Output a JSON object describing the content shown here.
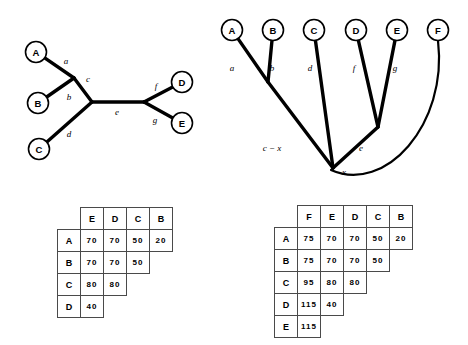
{
  "figure": {
    "unrooted_tree": {
      "name": "unrooted-phylogenetic-tree",
      "taxa": [
        {
          "id": "A",
          "label": "A",
          "cx": 36,
          "cy": 52
        },
        {
          "id": "B",
          "label": "B",
          "cx": 38,
          "cy": 103
        },
        {
          "id": "C",
          "label": "C",
          "cx": 39,
          "cy": 149
        },
        {
          "id": "D",
          "label": "D",
          "cx": 182,
          "cy": 82
        },
        {
          "id": "E",
          "label": "E",
          "cx": 182,
          "cy": 123
        }
      ],
      "internal_nodes": [
        {
          "id": "ab",
          "x": 74,
          "y": 78
        },
        {
          "id": "abc",
          "x": 92,
          "y": 102
        },
        {
          "id": "de",
          "x": 144,
          "y": 102
        }
      ],
      "edges": [
        {
          "id": "a",
          "label": "a",
          "from": "A",
          "to": "ab",
          "lx": 66,
          "ly": 61
        },
        {
          "id": "b",
          "label": "b",
          "from": "B",
          "to": "ab",
          "lx": 69,
          "ly": 97
        },
        {
          "id": "c",
          "label": "c",
          "from": "ab",
          "to": "abc",
          "lx": 88,
          "ly": 79
        },
        {
          "id": "d",
          "label": "d",
          "from": "C",
          "to": "abc",
          "lx": 69,
          "ly": 134
        },
        {
          "id": "e",
          "label": "e",
          "from": "abc",
          "to": "de",
          "lx": 117,
          "ly": 112
        },
        {
          "id": "f",
          "label": "f",
          "from": "de",
          "to": "D",
          "lx": 156,
          "ly": 86
        },
        {
          "id": "g",
          "label": "g",
          "from": "de",
          "to": "E",
          "lx": 155,
          "ly": 120
        }
      ]
    },
    "rooted_tree": {
      "name": "rooted-phylogenetic-tree",
      "taxa": [
        {
          "id": "A",
          "label": "A",
          "cx": 232,
          "cy": 30
        },
        {
          "id": "B",
          "label": "B",
          "cx": 273,
          "cy": 30
        },
        {
          "id": "C",
          "label": "C",
          "cx": 314,
          "cy": 30
        },
        {
          "id": "D",
          "label": "D",
          "cx": 356,
          "cy": 30
        },
        {
          "id": "E",
          "label": "E",
          "cx": 397,
          "cy": 30
        },
        {
          "id": "F",
          "label": "F",
          "cx": 438,
          "cy": 30
        }
      ],
      "internal_nodes": [
        {
          "id": "ab",
          "x": 268,
          "y": 82
        },
        {
          "id": "de",
          "x": 378,
          "y": 127
        },
        {
          "id": "x",
          "x": 333,
          "y": 168
        }
      ],
      "edges": [
        {
          "id": "a",
          "label": "a",
          "from": "A",
          "to": "ab",
          "lx": 232,
          "ly": 68
        },
        {
          "id": "b",
          "label": "b",
          "from": "B",
          "to": "ab",
          "lx": 272,
          "ly": 68
        },
        {
          "id": "d",
          "label": "d",
          "from": "C",
          "to": "x",
          "lx": 310,
          "ly": 68
        },
        {
          "id": "f",
          "label": "f",
          "from": "D",
          "to": "de",
          "lx": 354,
          "ly": 68
        },
        {
          "id": "g",
          "label": "g",
          "from": "E",
          "to": "de",
          "lx": 395,
          "ly": 68
        },
        {
          "id": "c-x",
          "label": "c − x",
          "from": "ab",
          "to": "x",
          "lx": 272,
          "ly": 148
        },
        {
          "id": "e",
          "label": "e",
          "from": "de",
          "to": "x",
          "lx": 361,
          "ly": 148
        },
        {
          "id": "x",
          "label": "x",
          "from": "root",
          "to": "x",
          "lx": 344,
          "ly": 172
        }
      ],
      "outgroup_branch": {
        "taxon": "F",
        "style": "curved"
      }
    }
  },
  "distance_matrix_left": {
    "name": "distance-matrix-5-taxa",
    "columns": [
      "E",
      "D",
      "C",
      "B"
    ],
    "rows": [
      {
        "label": "A",
        "values": [
          "70",
          "70",
          "50",
          "20"
        ]
      },
      {
        "label": "B",
        "values": [
          "70",
          "70",
          "50"
        ]
      },
      {
        "label": "C",
        "values": [
          "80",
          "80"
        ]
      },
      {
        "label": "D",
        "values": [
          "40"
        ]
      }
    ]
  },
  "distance_matrix_right": {
    "name": "distance-matrix-6-taxa",
    "columns": [
      "F",
      "E",
      "D",
      "C",
      "B"
    ],
    "rows": [
      {
        "label": "A",
        "values": [
          "75",
          "70",
          "70",
          "50",
          "20"
        ]
      },
      {
        "label": "B",
        "values": [
          "75",
          "70",
          "70",
          "50"
        ]
      },
      {
        "label": "C",
        "values": [
          "95",
          "80",
          "80"
        ]
      },
      {
        "label": "D",
        "values": [
          "115",
          "40"
        ]
      },
      {
        "label": "E",
        "values": [
          "115"
        ]
      }
    ]
  },
  "colors": {
    "stroke": "#000000",
    "background": "#ffffff",
    "table_border": "#4a4a4a"
  }
}
